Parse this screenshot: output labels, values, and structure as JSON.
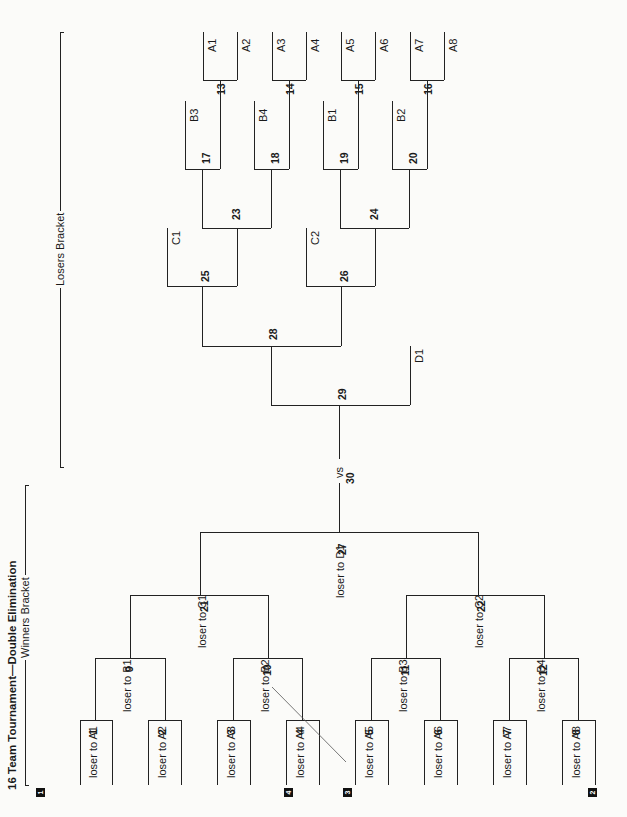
{
  "title": "16 Team Tournament—Double Elimination",
  "sections": {
    "winners": "Winners Bracket",
    "losers": "Losers Bracket"
  },
  "corner_badges": [
    "1",
    "4",
    "3",
    "2"
  ],
  "winners_bracket": {
    "round1": [
      {
        "game": "1",
        "label": "loser to A1"
      },
      {
        "game": "2",
        "label": "loser to A2"
      },
      {
        "game": "3",
        "label": "loser to A3"
      },
      {
        "game": "4",
        "label": "loser to A4"
      },
      {
        "game": "5",
        "label": "loser to A5"
      },
      {
        "game": "6",
        "label": "loser to A6"
      },
      {
        "game": "7",
        "label": "loser to A7"
      },
      {
        "game": "8",
        "label": "loser to A8"
      }
    ],
    "round2": [
      {
        "game": "9",
        "label": "loser to B1"
      },
      {
        "game": "10",
        "label": "loser to B2"
      },
      {
        "game": "11",
        "label": "loser to B3"
      },
      {
        "game": "12",
        "label": "loser to B4"
      }
    ],
    "round3": [
      {
        "game": "21",
        "label": "loser to C1"
      },
      {
        "game": "22",
        "label": "loser to C2"
      }
    ],
    "round4": {
      "game": "27",
      "label": "loser to D1"
    }
  },
  "final": {
    "vs": "vs",
    "game": "30"
  },
  "losers_bracket": {
    "round1": [
      {
        "game": "13",
        "top": "A1",
        "bottom": "A2"
      },
      {
        "game": "14",
        "top": "A3",
        "bottom": "A4"
      },
      {
        "game": "15",
        "top": "A5",
        "bottom": "A6"
      },
      {
        "game": "16",
        "top": "A7",
        "bottom": "A8"
      }
    ],
    "round2": [
      {
        "game": "17",
        "entrant": "B3"
      },
      {
        "game": "18",
        "entrant": "B4"
      },
      {
        "game": "19",
        "entrant": "B1"
      },
      {
        "game": "20",
        "entrant": "B2"
      }
    ],
    "round3": [
      {
        "game": "23"
      },
      {
        "game": "24"
      }
    ],
    "round4": [
      {
        "game": "25",
        "entrant": "C1"
      },
      {
        "game": "26",
        "entrant": "C2"
      }
    ],
    "round5": {
      "game": "28"
    },
    "round6": {
      "game": "29",
      "entrant": "D1"
    }
  }
}
